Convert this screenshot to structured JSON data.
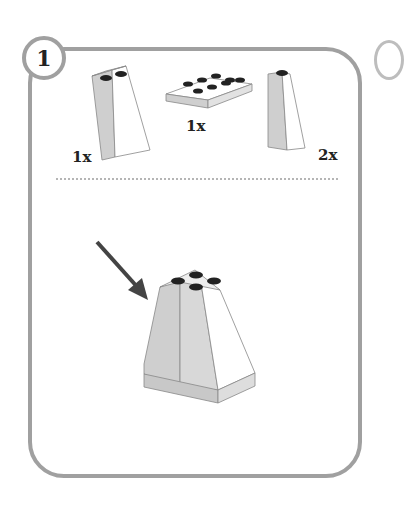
{
  "step": {
    "number": "1"
  },
  "parts": [
    {
      "name": "slope-brick-2x2",
      "quantity": "1x"
    },
    {
      "name": "plate-2x4",
      "quantity": "1x"
    },
    {
      "name": "slope-brick-1x2",
      "quantity": "2x"
    }
  ],
  "colors": {
    "frame": "#a0a0a0",
    "brick_light": "#ffffff",
    "brick_shade": "#cfcfcf",
    "stud": "#222222",
    "arrow": "#444444"
  }
}
